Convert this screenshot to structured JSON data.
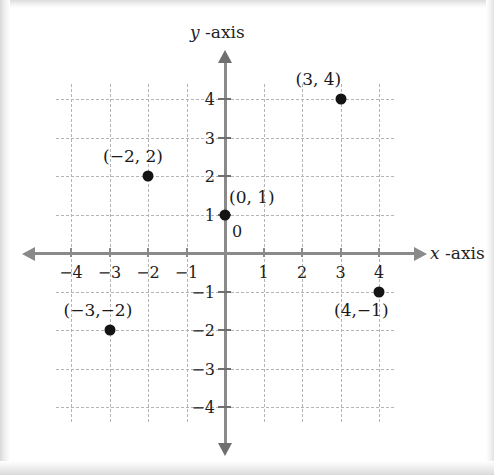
{
  "chart_data": {
    "type": "scatter",
    "title": "",
    "xlabel": "x -axis",
    "ylabel": "y -axis",
    "xlabel_var": "x",
    "xlabel_suffix": "-axis",
    "ylabel_var": "y",
    "ylabel_suffix": "-axis",
    "xlim": [
      -4.4,
      4.4
    ],
    "ylim": [
      -4.4,
      4.4
    ],
    "grid": true,
    "grid_style": "dashed",
    "legend": "none",
    "origin_label": "0",
    "x_ticks": [
      -4,
      -3,
      -2,
      -1,
      1,
      2,
      3,
      4
    ],
    "x_tick_labels": [
      "−4",
      "−3",
      "−2",
      "−1",
      "1",
      "2",
      "3",
      "4"
    ],
    "y_ticks": [
      4,
      3,
      2,
      1,
      -1,
      -2,
      -3,
      -4
    ],
    "y_tick_labels": [
      "4",
      "3",
      "2",
      "1",
      "−1",
      "−2",
      "−3",
      "−4"
    ],
    "points": [
      {
        "x": 3,
        "y": 4,
        "label": "(3, 4)",
        "label_pos": "above-left"
      },
      {
        "x": -2,
        "y": 2,
        "label": "(−2, 2)",
        "label_pos": "above-left"
      },
      {
        "x": 0,
        "y": 1,
        "label": "(0, 1)",
        "label_pos": "above-right"
      },
      {
        "x": -3,
        "y": -2,
        "label": "(−3,−2)",
        "label_pos": "above-center"
      },
      {
        "x": 4,
        "y": -1,
        "label": "(4,−1)",
        "label_pos": "below-left"
      }
    ],
    "colors": {
      "point": "#141414",
      "axis": "#8a8a8a",
      "grid": "#b4b4b4",
      "text": "#1a1a1a",
      "background": "#ffffff"
    }
  }
}
